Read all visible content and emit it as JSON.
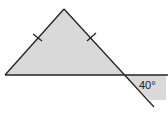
{
  "diagram": {
    "type": "geometry",
    "shape": "isosceles-triangle",
    "equal_side_marks": 2,
    "exterior_angle_label": "40°",
    "colors": {
      "fill": "#d9d9d9",
      "stroke": "#222222",
      "background": "#ffffff"
    }
  }
}
